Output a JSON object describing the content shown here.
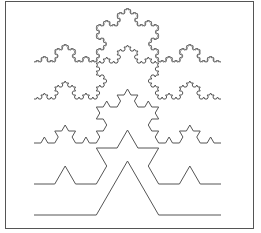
{
  "figure": {
    "frame": {
      "x": 5,
      "y": 1,
      "width": 249,
      "height": 228,
      "color": "#555555"
    },
    "stroke_color": "#555555",
    "curves": [
      {
        "level": 1,
        "x_start": 34,
        "x_end": 221,
        "baseline_y": 215
      },
      {
        "level": 2,
        "x_start": 34,
        "x_end": 221,
        "baseline_y": 184
      },
      {
        "level": 3,
        "x_start": 34,
        "x_end": 221,
        "baseline_y": 143
      },
      {
        "level": 4,
        "x_start": 34,
        "x_end": 221,
        "baseline_y": 99
      },
      {
        "level": 5,
        "x_start": 34,
        "x_end": 221,
        "baseline_y": 62
      }
    ]
  }
}
